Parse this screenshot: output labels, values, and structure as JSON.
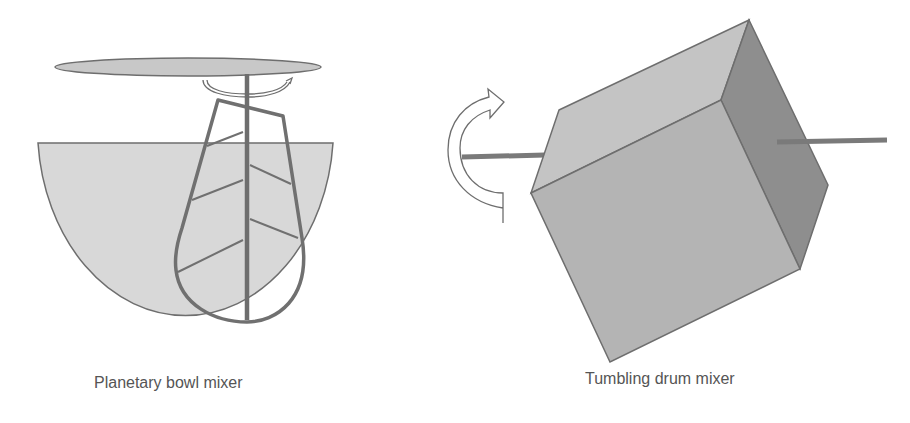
{
  "figure": {
    "panels": [
      {
        "id": "planetary",
        "caption": "Planetary bowl mixer",
        "components": [
          "top-disc",
          "drive-shaft",
          "rotation-arrow",
          "beater-paddle",
          "bowl"
        ]
      },
      {
        "id": "tumbling",
        "caption": "Tumbling drum mixer",
        "components": [
          "rotation-arrow",
          "left-axle",
          "cube-drum",
          "right-axle"
        ]
      }
    ],
    "colors": {
      "bowl_fill": "#d8d8d8",
      "disc_fill": "#c8c8c8",
      "stroke": "#6e6e6e",
      "paddle": "#707070",
      "cube_top": "#c4c4c4",
      "cube_front": "#b4b4b4",
      "cube_side": "#8e8e8e",
      "axle": "#7a7a7a",
      "caption": "#555555"
    }
  }
}
